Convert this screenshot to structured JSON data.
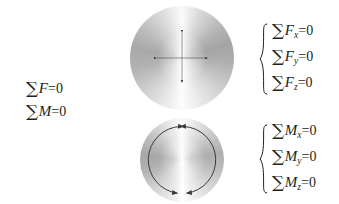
{
  "figure": {
    "background_color": "#ffffff",
    "text_color": "#231f20",
    "stroke_color": "#3a3a3a"
  },
  "summary_equations": {
    "name": "general-equilibrium-equations",
    "lines": [
      {
        "sigma": "∑",
        "variable": "F",
        "subscript": "",
        "relation": "=0"
      },
      {
        "sigma": "∑",
        "variable": "M",
        "subscript": "",
        "relation": "=0"
      }
    ]
  },
  "force_group": {
    "name": "force-component-equations",
    "brace": "{",
    "lines": [
      {
        "sigma": "∑",
        "variable": "F",
        "subscript": "x",
        "relation": "=0"
      },
      {
        "sigma": "∑",
        "variable": "F",
        "subscript": "y",
        "relation": "=0"
      },
      {
        "sigma": "∑",
        "variable": "F",
        "subscript": "z",
        "relation": "=0"
      }
    ]
  },
  "moment_group": {
    "name": "moment-component-equations",
    "brace": "{",
    "lines": [
      {
        "sigma": "∑",
        "variable": "M",
        "subscript": "x",
        "relation": "=0"
      },
      {
        "sigma": "∑",
        "variable": "M",
        "subscript": "y",
        "relation": "=0"
      },
      {
        "sigma": "∑",
        "variable": "M",
        "subscript": "z",
        "relation": "=0"
      }
    ]
  },
  "force_sphere": {
    "name": "force-sphere",
    "label": "sphere with four double-headed translation arrows",
    "center": {
      "x": 182,
      "y": 58
    },
    "radius": 52,
    "arrows": [
      {
        "name": "arrow-up",
        "direction": "up",
        "double_headed": true
      },
      {
        "name": "arrow-down",
        "direction": "down",
        "double_headed": true
      },
      {
        "name": "arrow-left",
        "direction": "left",
        "double_headed": true
      },
      {
        "name": "arrow-right",
        "direction": "right",
        "double_headed": true
      }
    ]
  },
  "moment_sphere": {
    "name": "moment-sphere",
    "label": "sphere with curved double-headed rotation arrows",
    "center": {
      "x": 182,
      "y": 160
    },
    "radius": 42,
    "arcs": [
      {
        "name": "arc-left",
        "double_headed": true
      },
      {
        "name": "arc-right",
        "double_headed": true
      }
    ]
  }
}
